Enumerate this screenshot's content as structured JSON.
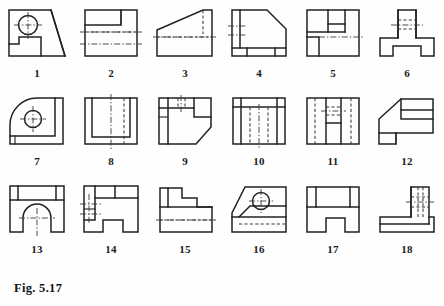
{
  "figure": {
    "caption": "Fig. 5.17",
    "plate_title": "Fig. 5.17",
    "type": "engineering-drawing-plate",
    "columns": 6,
    "rows": 3,
    "total_views": 18,
    "line_colors": {
      "visible_edge": "#222222",
      "hidden_edge": "#3a3a3a",
      "center_line": "#3a3a3a",
      "background": "#ffffff",
      "label_text": "#1a1a1a"
    }
  },
  "views": [
    {
      "number": "1",
      "description": "square block with circular hole, diagonal face and bottom-left notch"
    },
    {
      "number": "2",
      "description": "square block with stepped recess at top right and horizontal center lines"
    },
    {
      "number": "3",
      "description": "wedge with inclined top face and hidden lines"
    },
    {
      "number": "4",
      "description": "block with chamfered top-right corner and base strip"
    },
    {
      "number": "5",
      "description": "square block divided into steps with horizontal center line"
    },
    {
      "number": "6",
      "description": "T-shaped block with rectangular notch in base"
    },
    {
      "number": "7",
      "description": "quarter-round corner block with circular hole"
    },
    {
      "number": "8",
      "description": "square block with inner U channel and hidden vertical lines"
    },
    {
      "number": "9",
      "description": "square block with chamfered bottom-right corner and top-left step"
    },
    {
      "number": "10",
      "description": "square block with top band and hidden vertical lines"
    },
    {
      "number": "11",
      "description": "square block with central rib and hidden horizontal lines"
    },
    {
      "number": "12",
      "description": "L-shaped block with inclined top-left face and horizontal divisions"
    },
    {
      "number": "13",
      "description": "block with semicircular arch cutout and center lines"
    },
    {
      "number": "14",
      "description": "U-shaped block with center marks on the left face"
    },
    {
      "number": "15",
      "description": "stepped block with hidden horizontal line in base"
    },
    {
      "number": "16",
      "description": "inclined face block with circular hole and hidden line"
    },
    {
      "number": "17",
      "description": "block with rectangular notch in the bottom face"
    },
    {
      "number": "18",
      "description": "L-shaped block with vertical column and hidden lines"
    }
  ]
}
